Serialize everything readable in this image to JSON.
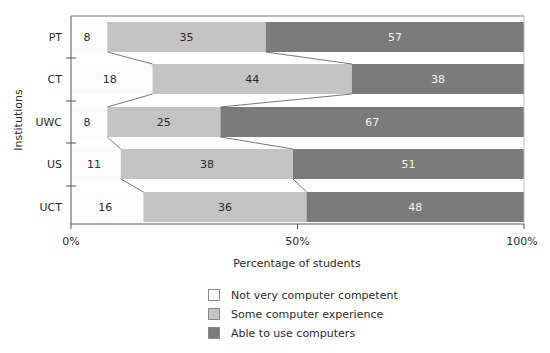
{
  "chart_data": {
    "type": "bar",
    "orientation": "horizontal",
    "stacked": true,
    "normalized_percent": true,
    "title": "",
    "xlabel": "Percentage of students",
    "ylabel": "Institutions",
    "xlim": [
      0,
      100
    ],
    "x_ticks": [
      "0%",
      "50%",
      "100%"
    ],
    "categories": [
      "PT",
      "CT",
      "UWC",
      "US",
      "UCT"
    ],
    "series": [
      {
        "name": "Not very computer competent",
        "color": "#fbfbfb",
        "values": [
          8,
          18,
          8,
          11,
          16
        ]
      },
      {
        "name": "Some computer experience",
        "color": "#c4c4c4",
        "values": [
          35,
          44,
          25,
          38,
          36
        ]
      },
      {
        "name": "Able to use computers",
        "color": "#7b7b7b",
        "values": [
          57,
          38,
          67,
          51,
          48
        ]
      }
    ],
    "connector_lines": true,
    "grid": false,
    "legend_position": "bottom"
  },
  "axis": {
    "x_title": "Percentage of students",
    "y_title": "Institutions",
    "x_ticks": [
      "0%",
      "50%",
      "100%"
    ]
  },
  "legend": [
    {
      "label": "Not very computer competent",
      "color": "#fbfbfb"
    },
    {
      "label": "Some computer experience",
      "color": "#c4c4c4"
    },
    {
      "label": "Able to use computers",
      "color": "#7b7b7b"
    }
  ]
}
